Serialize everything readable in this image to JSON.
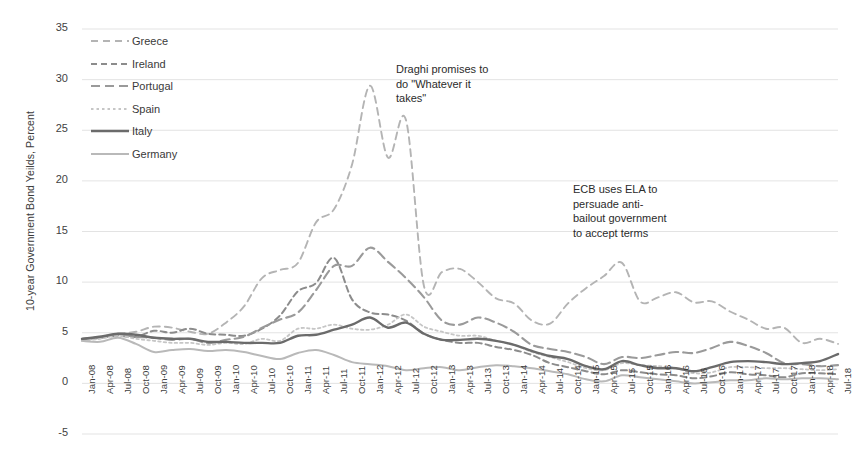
{
  "chart_data": {
    "type": "line",
    "title": "",
    "xlabel": "",
    "ylabel": "10-year Government Bond Yeilds, Percent",
    "ylim": [
      -5,
      35
    ],
    "ytick_step": 5,
    "yticks": [
      35,
      30,
      25,
      20,
      15,
      10,
      5,
      0,
      -5
    ],
    "grid": true,
    "legend_position": "top-left",
    "categories": [
      "Jan-08",
      "Apr-08",
      "Jul-08",
      "Oct-08",
      "Jan-09",
      "Apr-09",
      "Jul-09",
      "Oct-09",
      "Jan-10",
      "Apr-10",
      "Jul-10",
      "Oct-10",
      "Jan-11",
      "Apr-11",
      "Jul-11",
      "Oct-11",
      "Jan-12",
      "Apr-12",
      "Jul-12",
      "Oct-12",
      "Jan-13",
      "Apr-13",
      "Jul-13",
      "Oct-13",
      "Jan-14",
      "Apr-14",
      "Jul-14",
      "Oct-14",
      "Jan-15",
      "Apr-15",
      "Jul-15",
      "Oct-15",
      "Jan-16",
      "Apr-16",
      "Jul-16",
      "Oct-16",
      "Jan-17",
      "Apr-17",
      "Jul-17",
      "Oct-17",
      "Jan-18",
      "Apr-18",
      "Jul-18"
    ],
    "series": [
      {
        "name": "Greece",
        "color": "#b4b4b4",
        "style": "dashed",
        "width": 1.9,
        "values": [
          4.4,
          4.6,
          4.9,
          5.1,
          5.6,
          5.5,
          5.1,
          4.9,
          6.0,
          7.6,
          10.4,
          11.2,
          11.9,
          15.9,
          17.2,
          21.6,
          29.4,
          22.3,
          26.0,
          9.6,
          11.0,
          11.3,
          10.0,
          8.4,
          7.9,
          6.2,
          5.9,
          7.9,
          9.4,
          10.6,
          11.9,
          8.1,
          8.5,
          9.0,
          8.0,
          8.1,
          7.1,
          6.3,
          5.4,
          5.5,
          4.0,
          4.4,
          3.9
        ]
      },
      {
        "name": "Ireland",
        "color": "#8c8c8c",
        "style": "dashed-med",
        "width": 2.0,
        "values": [
          4.3,
          4.5,
          4.7,
          4.6,
          5.2,
          5.0,
          5.4,
          4.9,
          4.8,
          4.7,
          5.4,
          6.7,
          9.1,
          9.9,
          12.4,
          8.3,
          7.0,
          6.8,
          6.2,
          4.9,
          4.3,
          4.0,
          4.0,
          3.6,
          3.3,
          2.8,
          2.0,
          1.6,
          1.2,
          0.9,
          1.3,
          1.1,
          0.9,
          0.8,
          0.5,
          0.7,
          1.1,
          0.9,
          0.8,
          0.6,
          1.0,
          1.0,
          0.9
        ]
      },
      {
        "name": "Portugal",
        "color": "#9a9a9a",
        "style": "dashed-long",
        "width": 2.1,
        "values": [
          4.4,
          4.5,
          4.8,
          4.6,
          4.5,
          4.3,
          4.4,
          4.0,
          4.3,
          4.6,
          5.5,
          6.3,
          7.0,
          9.2,
          11.6,
          11.6,
          13.4,
          12.0,
          10.4,
          8.5,
          6.2,
          5.8,
          6.5,
          6.0,
          5.1,
          3.8,
          3.4,
          3.1,
          2.6,
          1.9,
          2.6,
          2.5,
          2.8,
          3.1,
          3.0,
          3.5,
          4.1,
          3.7,
          3.0,
          2.0,
          1.9,
          1.7,
          1.8
        ]
      },
      {
        "name": "Spain",
        "color": "#c6c6c6",
        "style": "dotted",
        "width": 1.8,
        "values": [
          4.2,
          4.4,
          4.7,
          4.4,
          4.2,
          4.0,
          4.0,
          3.8,
          4.0,
          3.9,
          4.4,
          4.2,
          5.4,
          5.4,
          5.8,
          5.4,
          5.3,
          5.8,
          6.8,
          5.6,
          5.1,
          4.7,
          4.7,
          4.2,
          3.8,
          3.1,
          2.6,
          2.1,
          1.5,
          1.3,
          2.0,
          1.8,
          1.7,
          1.5,
          1.0,
          1.1,
          1.6,
          1.6,
          1.5,
          1.5,
          1.4,
          1.3,
          1.4
        ]
      },
      {
        "name": "Italy",
        "color": "#6b6b6b",
        "style": "solid",
        "width": 2.4,
        "values": [
          4.4,
          4.6,
          4.9,
          4.8,
          4.5,
          4.4,
          4.4,
          4.1,
          4.1,
          4.0,
          4.0,
          4.0,
          4.7,
          4.8,
          5.3,
          5.8,
          6.5,
          5.5,
          6.0,
          4.9,
          4.3,
          4.3,
          4.4,
          4.2,
          3.8,
          3.2,
          2.7,
          2.4,
          1.7,
          1.4,
          2.2,
          1.8,
          1.5,
          1.5,
          1.2,
          1.6,
          2.1,
          2.2,
          2.1,
          1.9,
          2.0,
          2.2,
          2.9
        ]
      },
      {
        "name": "Germany",
        "color": "#b9b9b9",
        "style": "solid-light",
        "width": 2.0,
        "values": [
          4.2,
          4.1,
          4.5,
          3.9,
          3.1,
          3.3,
          3.4,
          3.2,
          3.3,
          3.1,
          2.7,
          2.4,
          3.0,
          3.3,
          2.8,
          2.1,
          1.9,
          1.7,
          1.3,
          1.5,
          1.6,
          1.3,
          1.6,
          1.8,
          1.7,
          1.5,
          1.2,
          0.9,
          0.4,
          0.2,
          0.8,
          0.6,
          0.4,
          0.2,
          0.0,
          0.1,
          0.3,
          0.3,
          0.5,
          0.4,
          0.5,
          0.5,
          0.4
        ]
      }
    ],
    "annotations": [
      {
        "id": "draghi",
        "text": "Draghi promises to\ndo \"Whatever it\ntakes\""
      },
      {
        "id": "ecb",
        "text": "ECB uses ELA to\npersuade anti-\nbailout government\nto accept terms"
      }
    ]
  }
}
